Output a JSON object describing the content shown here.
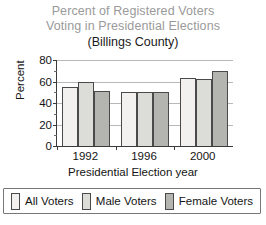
{
  "chart_data": {
    "type": "bar",
    "title": "Percent of Registered Voters Voting in Presidential Elections",
    "title_lines": [
      "Percent of Registered Voters",
      "Voting in Presidential Elections"
    ],
    "subtitle": "(Billings County)",
    "xlabel": "Presidential Election year",
    "ylabel": "Percent",
    "categories": [
      "1992",
      "1996",
      "2000"
    ],
    "series": [
      {
        "name": "All Voters",
        "values": [
          55,
          50,
          63
        ],
        "color": "#f2f1ef"
      },
      {
        "name": "Male Voters",
        "values": [
          60,
          50,
          62
        ],
        "color": "#dcdcd8"
      },
      {
        "name": "Female Voters",
        "values": [
          51,
          50,
          70
        ],
        "color": "#b4b4b0"
      }
    ],
    "ylim": [
      0,
      80
    ],
    "yticks": [
      0,
      20,
      40,
      60,
      80
    ],
    "ytick_labels": [
      "0",
      "20",
      "40",
      "60",
      "80"
    ],
    "grid": true,
    "legend_position": "bottom",
    "title_color": "#9a9a9a",
    "subtitle_color": "#1a1a1a",
    "axis_color": "#3a3a3a",
    "gridline_color": "#b8b8b8",
    "bar_border_color": "#4a4a4a"
  }
}
